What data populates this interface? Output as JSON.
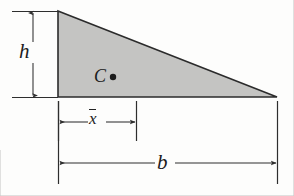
{
  "figure": {
    "kind": "geometry-diagram",
    "background_color": "#fdfdfc",
    "shape": {
      "name": "right-triangle",
      "fill_color": "#c4c4c2",
      "stroke_color": "#2b2b2b",
      "vertices": [
        {
          "name": "top-left",
          "x": 58,
          "y": 11
        },
        {
          "name": "bottom-right",
          "x": 277,
          "y": 97
        },
        {
          "name": "bottom-left",
          "x": 58,
          "y": 97
        }
      ]
    },
    "centroid": {
      "label": "C",
      "marker": "filled-dot",
      "marker_x": 113,
      "marker_y": 77,
      "marker_radius": 3.2,
      "color": "#1c1c1c"
    },
    "dimensions": [
      {
        "id": "height",
        "label": "h",
        "orientation": "vertical",
        "arrow_x": 33,
        "from_y": 11,
        "to_y": 97,
        "extension_lines": [
          {
            "y": 11,
            "x1": 12,
            "x2": 58
          },
          {
            "y": 97,
            "x1": 12,
            "x2": 58
          }
        ]
      },
      {
        "id": "centroid-distance",
        "label": "x̄",
        "label_plain": "x-bar",
        "orientation": "horizontal",
        "arrow_y": 122,
        "from_x": 58,
        "to_x": 136,
        "extension_lines": [
          {
            "x": 58,
            "y1": 101,
            "y2": 141
          },
          {
            "x": 136,
            "y1": 101,
            "y2": 141
          }
        ]
      },
      {
        "id": "base",
        "label": "b",
        "orientation": "horizontal",
        "arrow_y": 163,
        "from_x": 58,
        "to_x": 277,
        "extension_lines": [
          {
            "x": 58,
            "y1": 101,
            "y2": 184
          },
          {
            "x": 277,
            "y1": 101,
            "y2": 184
          }
        ]
      }
    ],
    "line_color": "#2e2e2e"
  }
}
